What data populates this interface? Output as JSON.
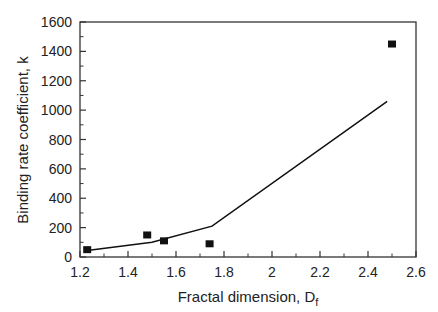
{
  "chart_data": {
    "type": "scatter",
    "title": "",
    "xlabel": "Fractal dimension, D",
    "xlabel_subscript": "f",
    "ylabel": "Binding rate coefficient, k",
    "xlim": [
      1.2,
      2.6
    ],
    "ylim": [
      0,
      1600
    ],
    "xticks": [
      1.2,
      1.4,
      1.6,
      1.8,
      2,
      2.2,
      2.4,
      2.6
    ],
    "xtick_labels": [
      "1.2",
      "1.4",
      "1.6",
      "1.8",
      "2",
      "2.2",
      "2.4",
      "2.6"
    ],
    "yticks": [
      0,
      200,
      400,
      600,
      800,
      1000,
      1200,
      1400,
      1600
    ],
    "ytick_labels": [
      "0",
      "200",
      "400",
      "600",
      "800",
      "1000",
      "1200",
      "1400",
      "1600"
    ],
    "grid": false,
    "legend": null,
    "series": [
      {
        "name": "Experimental data",
        "kind": "scatter",
        "marker": "square",
        "color": "#111111",
        "x": [
          1.23,
          1.48,
          1.55,
          1.74,
          2.5
        ],
        "y": [
          50,
          150,
          110,
          90,
          1450
        ]
      },
      {
        "name": "Model fit",
        "kind": "line",
        "color": "#111111",
        "x": [
          1.23,
          1.5,
          1.75,
          2.48
        ],
        "y": [
          45,
          100,
          210,
          1060
        ]
      }
    ]
  }
}
